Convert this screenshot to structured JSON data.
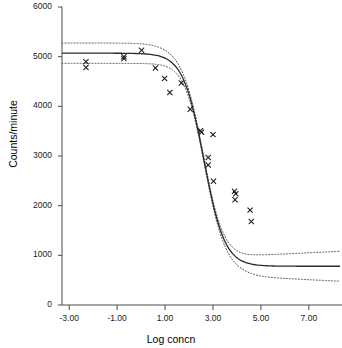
{
  "chart_data": {
    "type": "scatter",
    "title": "",
    "xlabel": "Log concn",
    "ylabel": "Counts/minute",
    "xlim": [
      -3.3,
      8.3
    ],
    "ylim": [
      0,
      6000
    ],
    "grid": false,
    "legend": null,
    "xticks": [
      -3.0,
      -1.0,
      1.0,
      3.0,
      5.0,
      7.0
    ],
    "xtick_labels": [
      "-3.00",
      "-1.00",
      "1.00",
      "3.00",
      "5.00",
      "7.00"
    ],
    "yticks": [
      0,
      1000,
      2000,
      3000,
      4000,
      5000,
      6000
    ],
    "ytick_labels": [
      "0",
      "1000",
      "2000",
      "3000",
      "4000",
      "5000",
      "6000"
    ],
    "marker": "x",
    "marker_color": "#1a1a1a",
    "points": [
      {
        "x": -2.3,
        "y": 4900
      },
      {
        "x": -2.3,
        "y": 4780
      },
      {
        "x": -0.72,
        "y": 5000
      },
      {
        "x": -0.72,
        "y": 4960
      },
      {
        "x": 0.02,
        "y": 5130
      },
      {
        "x": 0.6,
        "y": 4770
      },
      {
        "x": 0.98,
        "y": 4560
      },
      {
        "x": 1.2,
        "y": 4280
      },
      {
        "x": 1.68,
        "y": 4470
      },
      {
        "x": 2.05,
        "y": 3940
      },
      {
        "x": 2.48,
        "y": 3510
      },
      {
        "x": 2.52,
        "y": 3480
      },
      {
        "x": 2.8,
        "y": 2970
      },
      {
        "x": 2.8,
        "y": 2820
      },
      {
        "x": 3.0,
        "y": 3430
      },
      {
        "x": 3.02,
        "y": 2490
      },
      {
        "x": 3.9,
        "y": 2290
      },
      {
        "x": 3.95,
        "y": 2240
      },
      {
        "x": 3.92,
        "y": 2120
      },
      {
        "x": 4.55,
        "y": 1910
      },
      {
        "x": 4.6,
        "y": 1680
      }
    ],
    "series": [
      {
        "name": "fitted-curve",
        "style": "solid",
        "color": "#2b2b2b",
        "model": "four-parameter-logistic",
        "params": {
          "top": 5070,
          "bottom": 780,
          "logEC50": 2.62,
          "slope": 1.0
        },
        "x": [
          -3.3,
          -2.8,
          -2.3,
          -1.8,
          -1.3,
          -0.8,
          -0.3,
          0.2,
          0.7,
          1.2,
          1.7,
          2.2,
          2.7,
          3.2,
          3.7,
          4.2,
          4.7,
          5.2,
          5.7,
          6.2,
          6.7,
          7.2,
          7.7,
          8.2
        ],
        "y": [
          5062,
          5054,
          5043,
          5028,
          5007,
          4978,
          4939,
          4886,
          4815,
          4723,
          4604,
          4455,
          4274,
          4064,
          3831,
          3586,
          3339,
          3103,
          2886,
          2693,
          2526,
          2385,
          2267,
          2170
        ]
      },
      {
        "name": "upper-confidence-band",
        "style": "dotted",
        "color": "#4d4d4d",
        "x": [
          -3.3,
          -2.3,
          -1.3,
          -0.3,
          0.7,
          1.7,
          2.7,
          3.7,
          4.7,
          5.7,
          6.7,
          7.7,
          8.2
        ],
        "y": [
          5290,
          5270,
          5240,
          5190,
          5060,
          4830,
          4480,
          4040,
          3560,
          3120,
          2760,
          2500,
          2400
        ]
      },
      {
        "name": "lower-confidence-band",
        "style": "dotted",
        "color": "#4d4d4d",
        "x": [
          -3.3,
          -2.3,
          -1.3,
          -0.3,
          0.7,
          1.7,
          2.7,
          3.7,
          4.7,
          5.7,
          6.7,
          7.7,
          8.2
        ],
        "y": [
          4850,
          4840,
          4820,
          4780,
          4700,
          4530,
          4180,
          3700,
          3150,
          2640,
          2230,
          1940,
          1840
        ]
      }
    ]
  },
  "axes": {
    "x_title": "Log concn",
    "y_title": "Counts/minute"
  }
}
